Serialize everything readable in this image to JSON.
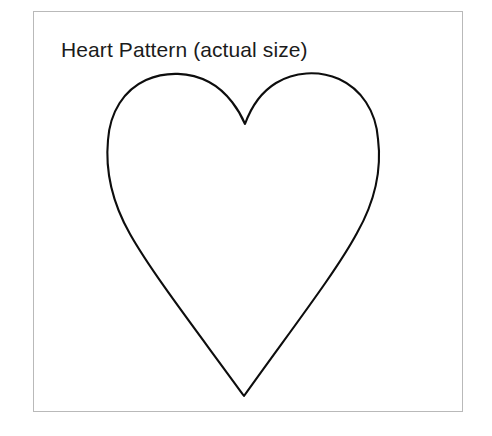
{
  "canvas": {
    "width": 492,
    "height": 436,
    "background_color": "#ffffff"
  },
  "frame": {
    "name": "pattern-sheet-border",
    "left": 33,
    "top": 11,
    "width": 430,
    "height": 401,
    "border_color": "#b9b9b9",
    "border_width": 1,
    "fill_color": "#ffffff"
  },
  "title": {
    "text": "Heart Pattern (actual size)",
    "color": "#1b1b1b",
    "font_size_px": 21,
    "left": 61,
    "top": 37
  },
  "heart": {
    "label": "heart-pattern-outline",
    "stroke_color": "#0d0d0d",
    "fill": "none",
    "stroke_width": 2.1,
    "left_lobe_apex": [
      175,
      76
    ],
    "right_lobe_apex": [
      308,
      76
    ],
    "center_cleft": [
      245,
      124
    ],
    "bottom_point": [
      244,
      396
    ],
    "leftmost": [
      108,
      176
    ],
    "rightmost": [
      378,
      176
    ],
    "path": "M 245 124 C 240 112 228 92 209 82 C 190 72 166 71 146 80 C 124 90 110 112 108 140 C 105 172 113 204 130 234 C 152 273 196 330 244 396 C 291 330 336 272 357 233 C 374 203 382 171 378 139 C 376 111 361 89 339 79 C 318 70 294 72 276 83 C 258 94 249 113 245 124 Z"
  }
}
